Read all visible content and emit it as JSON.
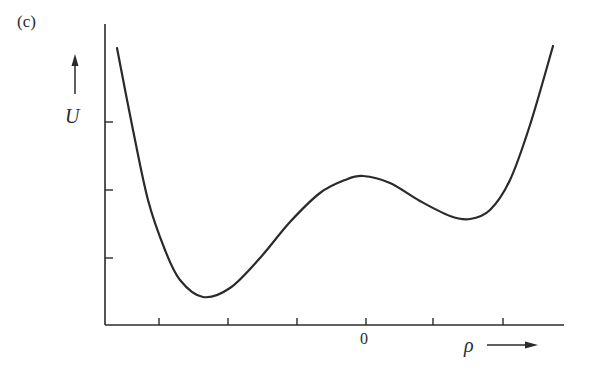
{
  "chart_data": {
    "type": "line",
    "panel_label": "(c)",
    "title": "",
    "xlabel": "ρ",
    "ylabel": "U",
    "x_tick_labels": [
      "",
      "",
      "",
      "0",
      "",
      ""
    ],
    "y_tick_labels": [
      "",
      "",
      ""
    ],
    "grid": false,
    "legend": null,
    "series": [
      {
        "name": "U(ρ)",
        "x_px": [
          117,
          133,
          148,
          165,
          180,
          203,
          230,
          260,
          290,
          320,
          345,
          363,
          390,
          420,
          450,
          470,
          490,
          510,
          530,
          553
        ],
        "y_px": [
          48,
          130,
          200,
          250,
          280,
          297,
          288,
          258,
          222,
          193,
          180,
          176,
          183,
          201,
          216,
          219,
          210,
          180,
          125,
          46
        ]
      }
    ],
    "features": {
      "global_minimum_px": [
        203,
        297
      ],
      "barrier_maximum_px": [
        363,
        176
      ],
      "local_minimum_px": [
        470,
        219
      ]
    }
  },
  "labels": {
    "panel": "(c)",
    "y_axis": "U",
    "x_axis": "ρ",
    "x_zero": "0"
  }
}
